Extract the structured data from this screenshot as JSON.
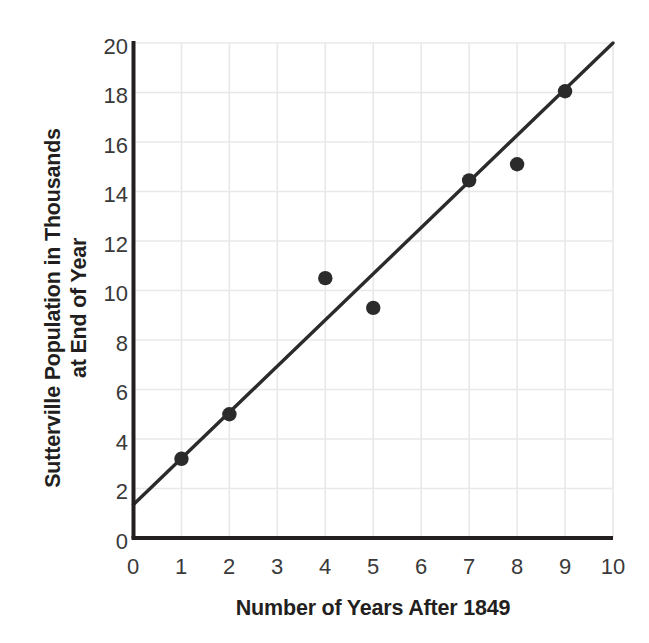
{
  "chart_data": {
    "type": "scatter",
    "title": "",
    "xlabel": "Number of Years After 1849",
    "ylabel": "Sutterville Population in Thousands at End of Year",
    "ylabel_line1": "Sutterville Population in Thousands",
    "ylabel_line2": "at End of Year",
    "xlim": [
      0,
      10
    ],
    "ylim": [
      0,
      20
    ],
    "xticks": [
      "0",
      "1",
      "2",
      "3",
      "4",
      "5",
      "6",
      "7",
      "8",
      "9",
      "10"
    ],
    "yticks": [
      "0",
      "2",
      "4",
      "6",
      "8",
      "10",
      "12",
      "14",
      "16",
      "18",
      "20"
    ],
    "grid": true,
    "legend": "none",
    "series": [
      {
        "name": "Sutterville population",
        "marker": "filled-circle",
        "color": "#2b2b2b",
        "points": [
          {
            "x": 1,
            "y": 3.2
          },
          {
            "x": 2,
            "y": 5.0
          },
          {
            "x": 4,
            "y": 10.5
          },
          {
            "x": 5,
            "y": 9.3
          },
          {
            "x": 7,
            "y": 14.45
          },
          {
            "x": 8,
            "y": 15.1
          },
          {
            "x": 9,
            "y": 18.05
          }
        ]
      }
    ],
    "trend_line": {
      "name": "line of best fit",
      "color": "#2b2b2b",
      "x_start": 0,
      "y_start": 1.35,
      "x_end": 10,
      "y_end": 20.0
    },
    "axis_color": "#231f20",
    "grid_color": "#e8e8ea",
    "background": "#ffffff"
  }
}
